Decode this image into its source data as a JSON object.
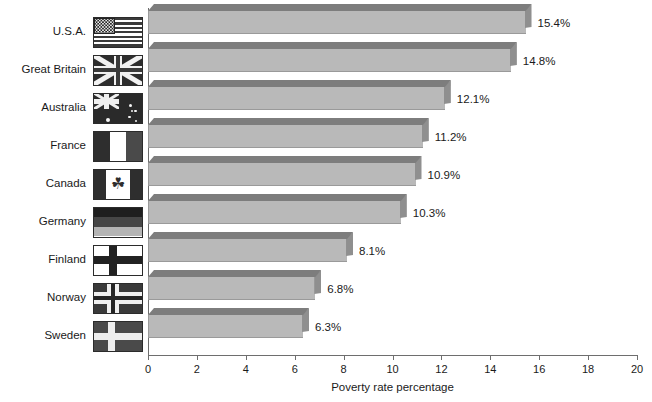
{
  "chart_data": {
    "type": "bar",
    "orientation": "horizontal",
    "title": "",
    "xlabel": "Poverty rate percentage",
    "ylabel": "",
    "xlim": [
      0,
      20
    ],
    "xticks": [
      0,
      2,
      4,
      6,
      8,
      10,
      12,
      14,
      16,
      18,
      20
    ],
    "grid": false,
    "legend": null,
    "value_label_suffix": "%",
    "categories": [
      "U.S.A.",
      "Great Britain",
      "Australia",
      "France",
      "Canada",
      "Germany",
      "Finland",
      "Norway",
      "Sweden"
    ],
    "values": [
      15.4,
      14.8,
      12.1,
      11.2,
      10.9,
      10.3,
      8.1,
      6.8,
      6.3
    ],
    "value_labels": [
      "15.4%",
      "14.8%",
      "12.1%",
      "11.2%",
      "10.9%",
      "10.3%",
      "8.1%",
      "6.8%",
      "6.3%"
    ],
    "series": [
      {
        "name": "Poverty rate percentage",
        "values": [
          15.4,
          14.8,
          12.1,
          11.2,
          10.9,
          10.3,
          8.1,
          6.8,
          6.3
        ]
      }
    ],
    "rows": [
      {
        "label": "U.S.A.",
        "value": 15.4,
        "value_label": "15.4%",
        "flag": "flag-usa"
      },
      {
        "label": "Great Britain",
        "value": 14.8,
        "value_label": "14.8%",
        "flag": "flag-uk"
      },
      {
        "label": "Australia",
        "value": 12.1,
        "value_label": "12.1%",
        "flag": "flag-australia"
      },
      {
        "label": "France",
        "value": 11.2,
        "value_label": "11.2%",
        "flag": "flag-france"
      },
      {
        "label": "Canada",
        "value": 10.9,
        "value_label": "10.9%",
        "flag": "flag-canada"
      },
      {
        "label": "Germany",
        "value": 10.3,
        "value_label": "10.3%",
        "flag": "flag-germany"
      },
      {
        "label": "Finland",
        "value": 8.1,
        "value_label": "8.1%",
        "flag": "flag-finland"
      },
      {
        "label": "Norway",
        "value": 6.8,
        "value_label": "6.8%",
        "flag": "flag-norway"
      },
      {
        "label": "Sweden",
        "value": 6.3,
        "value_label": "6.3%",
        "flag": "flag-sweden"
      }
    ],
    "colors": {
      "bar_front": "#b9b9b9",
      "bar_top": "#7d7d7d",
      "bar_side": "#8f8f8f",
      "axis": "#6e6e6e",
      "text": "#1a1a1a",
      "background": "#ffffff"
    }
  },
  "maple_leaf_glyph": "☘"
}
